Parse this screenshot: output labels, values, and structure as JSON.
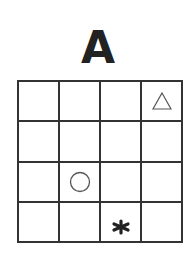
{
  "title": "A",
  "grid": {
    "rows": 4,
    "cols": 4,
    "cells": [
      [
        "",
        "",
        "",
        "triangle"
      ],
      [
        "",
        "",
        "",
        ""
      ],
      [
        "",
        "circle",
        "",
        ""
      ],
      [
        "",
        "",
        "star",
        ""
      ]
    ]
  },
  "colors": {
    "line": "#333333",
    "symbol_outline": "#555555",
    "star": "#222222"
  }
}
